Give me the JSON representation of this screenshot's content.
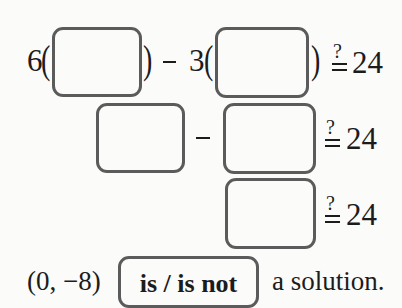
{
  "row1": {
    "coef1": "6",
    "minus": "−",
    "coef2": "3",
    "relation": "≟",
    "rhs": "24"
  },
  "row2": {
    "minus": "−",
    "relation": "≟",
    "rhs": "24"
  },
  "row3": {
    "relation": "≟",
    "rhs": "24"
  },
  "conclusion": {
    "point": "(0, −8)",
    "choice": "is / is not",
    "suffix": "a solution."
  }
}
